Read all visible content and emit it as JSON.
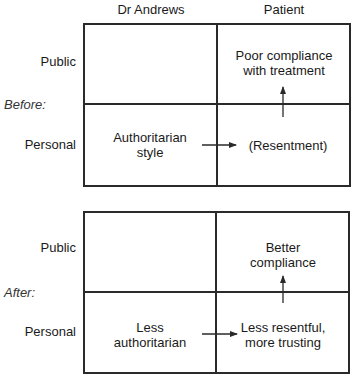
{
  "columns": {
    "left": "Dr Andrews",
    "right": "Patient"
  },
  "rows": {
    "public": "Public",
    "personal": "Personal"
  },
  "before": {
    "label": "Before:",
    "public_left": "",
    "public_right_line1": "Poor compliance",
    "public_right_line2": "with treatment",
    "personal_left_line1": "Authoritarian",
    "personal_left_line2": "style",
    "personal_right": "(Resentment)"
  },
  "after": {
    "label": "After:",
    "public_left": "",
    "public_right_line1": "Better",
    "public_right_line2": "compliance",
    "personal_left_line1": "Less",
    "personal_left_line2": "authoritarian",
    "personal_right_line1": "Less resentful,",
    "personal_right_line2": "more trusting"
  },
  "colors": {
    "line": "#2a2a2a",
    "text": "#1a1a1a"
  }
}
